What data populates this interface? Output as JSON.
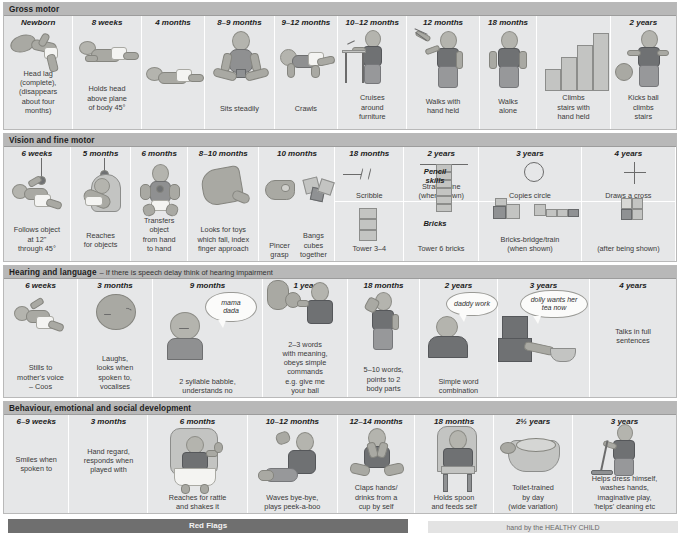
{
  "colors": {
    "section_header": "#b8b8b8",
    "cell": "#e6e7e8",
    "red_flag_bar": "#6f6f6f",
    "text": "#1b1b1b"
  },
  "sections": [
    {
      "id": "gross-motor",
      "header": "Gross motor",
      "subheader": "",
      "columns": [
        {
          "age": "Newborn",
          "caption": "Head lag\n(complete),\n(disappears\nabout four\nmonths)"
        },
        {
          "age": "8 weeks",
          "caption": "Holds head\nabove plane\nof body 45°"
        },
        {
          "age": "4 months",
          "caption": ""
        },
        {
          "age": "8–9 months",
          "caption": "Sits steadily"
        },
        {
          "age": "9–12 months",
          "caption": "Crawls"
        },
        {
          "age": "10–12 months",
          "caption": "Cruises\naround\nfurniture"
        },
        {
          "age": "12 months",
          "caption": "Walks with\nhand held"
        },
        {
          "age": "18 months",
          "caption": "Walks\nalone"
        },
        {
          "age": "18 months b",
          "caption": "Climbs\nstairs with\nhand held"
        },
        {
          "age": "2 years",
          "caption": "Kicks ball\nclimbs\nstairs"
        }
      ]
    },
    {
      "id": "vision-fine-motor",
      "header": "Vision and fine motor",
      "subheader": "",
      "columns": [
        {
          "age": "6 weeks",
          "caption": "Follows object\nat 12\"\nthrough 45°"
        },
        {
          "age": "5 months",
          "caption": "Reaches\nfor objects"
        },
        {
          "age": "6 months",
          "caption": "Transfers object\nfrom hand\nto hand"
        },
        {
          "age": "8–10 months",
          "caption": "Looks for toys\nwhich fall, index\nfinger approach"
        },
        {
          "age": "10 months",
          "caption": "Pincer\ngrasp",
          "caption2": "Bangs\ncubes\ntogether"
        },
        {
          "age": "18 months",
          "caption_pencil": "Scribble",
          "caption_bricks": "Tower 3–4"
        },
        {
          "age": "2 years",
          "caption_pencil": "Straight line\n(when shown)",
          "caption_bricks": "Tower 6 bricks"
        },
        {
          "age": "3 years",
          "caption_pencil": "Copies circle",
          "caption_bricks": "Bricks-bridge/train\n(when shown)"
        },
        {
          "age": "4 years",
          "caption_pencil": "Draws a cross",
          "caption_bricks": "(after being shown)"
        }
      ],
      "mid_labels": [
        "Pencil\nskills",
        "Bricks"
      ]
    },
    {
      "id": "hearing-language",
      "header": "Hearing and language",
      "subheader": "– If there is speech delay think of hearing impairment",
      "columns": [
        {
          "age": "6 weeks",
          "caption": "Stills to\nmother's voice\n– Coos"
        },
        {
          "age": "3 months",
          "caption": "Laughs,\nlooks when\nspoken to,\nvocalises"
        },
        {
          "age": "9 months",
          "caption": "2 syllable babble,\nunderstands no",
          "bubble": "mama\ndada"
        },
        {
          "age": "1 year",
          "caption": "2–3 words\nwith meaning,\nobeys simple\ncommands\ne.g. give me\nyour ball"
        },
        {
          "age": "18 months",
          "caption": "5–10 words,\npoints to 2\nbody parts"
        },
        {
          "age": "2 years",
          "caption": "Simple word\ncombination",
          "bubble": "daddy work"
        },
        {
          "age": "3 years",
          "caption": "",
          "bubble": "dolly wants her\ntea now"
        },
        {
          "age": "4 years",
          "caption": "Talks in full\nsentences"
        }
      ]
    },
    {
      "id": "behaviour-social",
      "header": "Behaviour, emotional and social development",
      "subheader": "",
      "columns": [
        {
          "age": "6–9 weeks",
          "caption": "Smiles when\nspoken to"
        },
        {
          "age": "3 months",
          "caption": "Hand regard,\nresponds when\nplayed with"
        },
        {
          "age": "6 months",
          "caption": "Reaches for rattle\nand shakes it"
        },
        {
          "age": "10–12 months",
          "caption": "Waves bye-bye,\nplays peek-a-boo"
        },
        {
          "age": "12–14 months",
          "caption": "Claps hands/\ndrinks from a\ncup by self"
        },
        {
          "age": "18 months",
          "caption": "Holds spoon\nand feeds self"
        },
        {
          "age": "2½ years",
          "caption": "Toilet-trained\nby day\n(wide variation)"
        },
        {
          "age": "3 years",
          "caption": "Helps dress himself,\nwashes hands,\nimaginative play,\n'helps' cleaning etc"
        }
      ]
    }
  ],
  "red_flags": {
    "left_label": "Red Flags",
    "right_label": "hand by the HEALTHY CHILD"
  }
}
